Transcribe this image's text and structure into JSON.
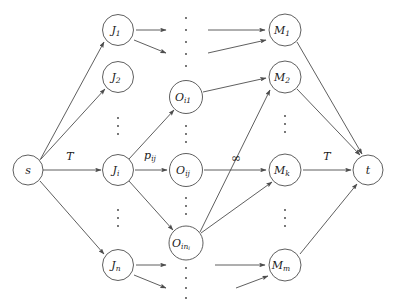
{
  "figure": {
    "type": "flow-network-diagram",
    "stroke_color": "#4d4d4d",
    "text_color": "#1a1a1a",
    "background": "#ffffff"
  },
  "nodes": {
    "source": {
      "id": "s",
      "label": "s",
      "sub": "",
      "cx": 28,
      "cy": 170,
      "r": 15
    },
    "sink": {
      "id": "t",
      "label": "t",
      "sub": "",
      "cx": 368,
      "cy": 170,
      "r": 15
    },
    "jobs": [
      {
        "id": "J1",
        "label": "J",
        "sub": "1",
        "cx": 118,
        "cy": 30,
        "r": 15.5
      },
      {
        "id": "J2",
        "label": "J",
        "sub": "2",
        "cx": 118,
        "cy": 77,
        "r": 15.5
      },
      {
        "id": "Ji",
        "label": "J",
        "sub": "i",
        "cx": 118,
        "cy": 170,
        "r": 15.5
      },
      {
        "id": "Jn",
        "label": "J",
        "sub": "n",
        "cx": 118,
        "cy": 265,
        "r": 15.5
      }
    ],
    "operations": [
      {
        "id": "Oi1",
        "label": "O",
        "sub": "i1",
        "cx": 186,
        "cy": 97,
        "r": 16.5
      },
      {
        "id": "Oij",
        "label": "O",
        "sub": "ij",
        "cx": 186,
        "cy": 170,
        "r": 16.5
      },
      {
        "id": "Oini",
        "label": "O",
        "sub": "in",
        "sub2": "i",
        "cx": 186,
        "cy": 243,
        "r": 17
      }
    ],
    "machines": [
      {
        "id": "M1",
        "label": "M",
        "sub": "1",
        "cx": 285,
        "cy": 30,
        "r": 16
      },
      {
        "id": "M2",
        "label": "M",
        "sub": "2",
        "cx": 285,
        "cy": 77,
        "r": 16
      },
      {
        "id": "Mk",
        "label": "M",
        "sub": "k",
        "cx": 285,
        "cy": 170,
        "r": 16
      },
      {
        "id": "Mm",
        "label": "M",
        "sub": "m",
        "cx": 285,
        "cy": 265,
        "r": 16
      }
    ]
  },
  "edge_labels": [
    {
      "id": "label-s-Ji",
      "text": "T",
      "sub": "",
      "x": 70,
      "y": 157,
      "style": "italic"
    },
    {
      "id": "label-Ji-Oij",
      "text": "p",
      "sub": "ij",
      "x": 152,
      "y": 156,
      "style": "italic"
    },
    {
      "id": "label-Oij-Mk",
      "text": "∞",
      "sub": "",
      "x": 236,
      "y": 157,
      "style": "symbol"
    },
    {
      "id": "label-Mk-t",
      "text": "T",
      "sub": "",
      "x": 327,
      "y": 157,
      "style": "italic"
    }
  ],
  "vertical_dots": [
    {
      "id": "dots-jobs-upper",
      "x": 118,
      "y": 125
    },
    {
      "id": "dots-jobs-lower",
      "x": 118,
      "y": 218
    },
    {
      "id": "dots-ops-top",
      "x": 186,
      "y": 45
    },
    {
      "id": "dots-ops-upper",
      "x": 186,
      "y": 134
    },
    {
      "id": "dots-ops-lower",
      "x": 186,
      "y": 206
    },
    {
      "id": "dots-ops-bottom",
      "x": 186,
      "y": 287
    },
    {
      "id": "dots-machines-upper",
      "x": 285,
      "y": 124
    },
    {
      "id": "dots-machines-lower",
      "x": 285,
      "y": 218
    }
  ],
  "legend": {
    "source_name": "source node",
    "sink_name": "sink node",
    "job_layer": "job nodes",
    "operation_layer": "operation nodes",
    "machine_layer": "machine nodes"
  }
}
